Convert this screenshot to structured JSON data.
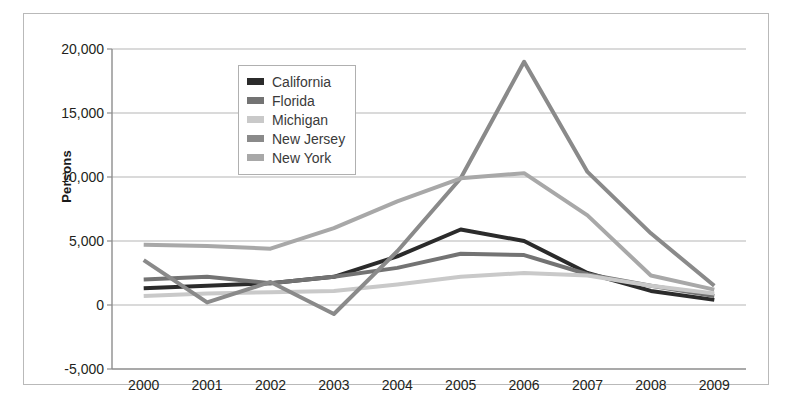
{
  "figure": {
    "border_color": "#b9b9b9",
    "background": "#ffffff"
  },
  "axis": {
    "ylabel": "Persons",
    "ytick_labels": [
      "20,000",
      "15,000",
      "10,000",
      "5,000",
      "0",
      "-5,000"
    ],
    "xtick_labels": [
      "2000",
      "2001",
      "2002",
      "2003",
      "2004",
      "2005",
      "2006",
      "2007",
      "2008",
      "2009"
    ]
  },
  "legend": {
    "position": "upper-center-left",
    "entries": [
      {
        "label": "California",
        "color": "#2b2b2b"
      },
      {
        "label": "Florida",
        "color": "#737373"
      },
      {
        "label": "Michigan",
        "color": "#c9c9c9"
      },
      {
        "label": "New Jersey",
        "color": "#8a8a8a"
      },
      {
        "label": "New York",
        "color": "#a8a8a8"
      }
    ]
  },
  "chart_data": {
    "type": "line",
    "title": "",
    "xlabel": "",
    "ylabel": "Persons",
    "categories": [
      "2000",
      "2001",
      "2002",
      "2003",
      "2004",
      "2005",
      "2006",
      "2007",
      "2008",
      "2009"
    ],
    "ylim": [
      -5000,
      20000
    ],
    "ytick_values": [
      20000,
      15000,
      10000,
      5000,
      0,
      -5000
    ],
    "grid": true,
    "legend_position": "upper-center-left",
    "series": [
      {
        "name": "California",
        "color": "#2b2b2b",
        "values": [
          1300,
          1500,
          1700,
          2200,
          3800,
          5900,
          5000,
          2500,
          1100,
          400
        ]
      },
      {
        "name": "Florida",
        "color": "#737373",
        "values": [
          2000,
          2200,
          1700,
          2200,
          2900,
          4000,
          3900,
          2400,
          1500,
          700
        ]
      },
      {
        "name": "Michigan",
        "color": "#c9c9c9",
        "values": [
          700,
          900,
          1000,
          1100,
          1600,
          2200,
          2500,
          2300,
          1500,
          900
        ]
      },
      {
        "name": "New Jersey",
        "color": "#8a8a8a",
        "values": [
          3500,
          200,
          1800,
          -700,
          4200,
          9900,
          19000,
          10400,
          5600,
          1500
        ]
      },
      {
        "name": "New York",
        "color": "#a8a8a8",
        "values": [
          4700,
          4600,
          4400,
          6000,
          8100,
          9900,
          10300,
          7000,
          2300,
          1200
        ]
      }
    ]
  }
}
